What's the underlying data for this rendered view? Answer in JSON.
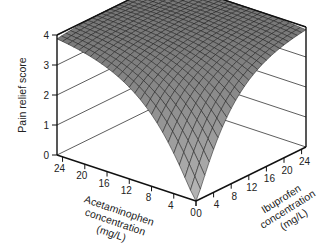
{
  "chart_data": {
    "type": "surface3d",
    "title": "",
    "zlabel": "Pain relief score",
    "xlabel": [
      "Acetaminophen",
      "concentration",
      "(mg/L)"
    ],
    "ylabel": [
      "Ibuprofen",
      "concentration",
      "(mg/L)"
    ],
    "x_ticks": [
      0,
      4,
      8,
      12,
      16,
      20,
      24
    ],
    "y_ticks": [
      0,
      4,
      8,
      12,
      16,
      20,
      24
    ],
    "z_ticks": [
      0,
      1,
      2,
      3,
      4
    ],
    "xlim": [
      0,
      25
    ],
    "ylim": [
      0,
      25
    ],
    "zlim": [
      0,
      4
    ],
    "grid_steps": 25,
    "surface_model": "response surface rising from 0 at (0,0) to ~4 at high concentrations; ~3.3 along each single-drug edge at 24 mg/L",
    "sample_values": [
      {
        "acetaminophen": 0,
        "ibuprofen": 0,
        "score": 0.0
      },
      {
        "acetaminophen": 24,
        "ibuprofen": 0,
        "score": 3.3
      },
      {
        "acetaminophen": 0,
        "ibuprofen": 24,
        "score": 3.5
      },
      {
        "acetaminophen": 24,
        "ibuprofen": 24,
        "score": 4.0
      },
      {
        "acetaminophen": 12,
        "ibuprofen": 12,
        "score": 3.4
      },
      {
        "acetaminophen": 8,
        "ibuprofen": 0,
        "score": 1.8
      },
      {
        "acetaminophen": 0,
        "ibuprofen": 8,
        "score": 2.0
      }
    ],
    "colors": {
      "surface": "#8c8c8c",
      "surface_light": "#b4b4b4",
      "mesh": "#1a1a1a",
      "axes": "#111111"
    }
  }
}
